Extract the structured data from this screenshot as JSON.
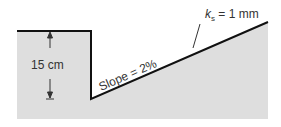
{
  "diagram": {
    "depth_label": "15 cm",
    "slope_label": "Slope = 2%",
    "roughness_symbol": "k",
    "roughness_subscript": "s",
    "roughness_value": " = 1 mm",
    "colors": {
      "ground_fill": "#dedede",
      "outline": "#111111",
      "text": "#333333"
    }
  }
}
